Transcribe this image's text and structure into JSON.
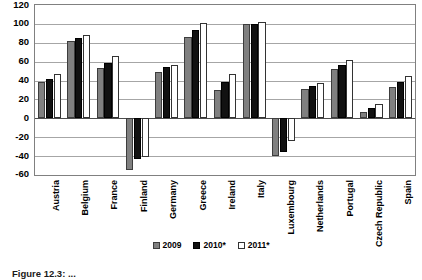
{
  "chart_data": {
    "type": "bar",
    "title": "",
    "subtitle": "",
    "xlabel": "",
    "ylabel": "",
    "ylim": [
      -60,
      120
    ],
    "ytick_step": 20,
    "yticks": [
      120,
      100,
      80,
      60,
      40,
      20,
      0,
      -20,
      -40,
      -60
    ],
    "ytick_labels": [
      "120",
      "100",
      "80",
      "60",
      "40",
      "20",
      "0",
      "-20",
      "-40",
      "-60"
    ],
    "grid": true,
    "grid_axis": "y",
    "legend_position": "bottom-center",
    "categories": [
      "Austria",
      "Belgium",
      "France",
      "Finland",
      "Germany",
      "Greece",
      "Ireland",
      "Italy",
      "Luxembourg",
      "Netherlands",
      "Portugal",
      "Czech Republic",
      "Spain"
    ],
    "series": [
      {
        "name": "2009",
        "color": "#808080",
        "values": [
          38,
          82,
          53,
          -55,
          49,
          86,
          30,
          100,
          -40,
          31,
          52,
          7,
          33
        ]
      },
      {
        "name": "2010*",
        "color": "#111111",
        "values": [
          42,
          85,
          59,
          -43,
          54,
          94,
          38,
          100,
          -36,
          34,
          57,
          11,
          39
        ]
      },
      {
        "name": "2011*",
        "color": "#ffffff",
        "values": [
          47,
          88,
          66,
          -41,
          57,
          101,
          47,
          102,
          -24,
          37,
          62,
          15,
          45
        ]
      }
    ]
  },
  "legend": {
    "items": [
      {
        "label": "2009",
        "swatch": "gray-square-icon"
      },
      {
        "label": "2010*",
        "swatch": "black-square-icon"
      },
      {
        "label": "2011*",
        "swatch": "white-square-icon"
      }
    ]
  },
  "caption": {
    "text": "Figure 12.3: ..."
  }
}
